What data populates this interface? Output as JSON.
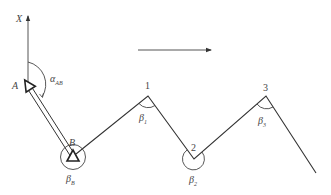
{
  "diagram": {
    "type": "traverse survey (open traverse) sketch",
    "axis": {
      "label": "X",
      "description": "north direction axis at point A"
    },
    "known_points": [
      {
        "id": "A",
        "label": "A"
      },
      {
        "id": "B",
        "label": "B"
      }
    ],
    "traverse_points": [
      {
        "id": "1",
        "label": "1"
      },
      {
        "id": "2",
        "label": "2"
      },
      {
        "id": "3",
        "label": "3"
      }
    ],
    "azimuth": {
      "label": "α",
      "subscript": "AB"
    },
    "angles": [
      {
        "at": "B",
        "label": "β",
        "subscript": "B"
      },
      {
        "at": "1",
        "label": "β",
        "subscript": "1"
      },
      {
        "at": "2",
        "label": "β",
        "subscript": "2"
      },
      {
        "at": "3",
        "label": "β",
        "subscript": "3"
      }
    ],
    "direction_arrow": {
      "description": "direction of traverse progression, pointing right"
    },
    "colors": {
      "line": "#333333",
      "text": "#444444",
      "background": "#ffffff"
    }
  }
}
